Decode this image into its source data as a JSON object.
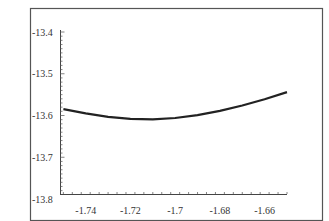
{
  "chart_data": {
    "type": "line",
    "title": "",
    "xlabel": "",
    "ylabel": "",
    "xlim": [
      -1.7515,
      -1.65
    ],
    "ylim": [
      -13.8,
      -13.4
    ],
    "grid": false,
    "legend": null,
    "x_ticks": [
      "-1.74",
      "-1.72",
      "-1.7",
      "-1.68",
      "-1.66"
    ],
    "x_tick_values": [
      -1.74,
      -1.72,
      -1.7,
      -1.68,
      -1.66
    ],
    "y_ticks": [
      "-13.4",
      "-13.5",
      "-13.6",
      "-13.7",
      "-13.8"
    ],
    "y_tick_values": [
      -13.4,
      -13.5,
      -13.6,
      -13.7,
      -13.8
    ],
    "series": [
      {
        "name": "curve",
        "color": "#222222",
        "x": [
          -1.75,
          -1.74,
          -1.73,
          -1.72,
          -1.71,
          -1.7,
          -1.69,
          -1.68,
          -1.67,
          -1.66,
          -1.65
        ],
        "y": [
          -13.585,
          -13.595,
          -13.603,
          -13.608,
          -13.609,
          -13.606,
          -13.599,
          -13.589,
          -13.576,
          -13.561,
          -13.544
        ]
      }
    ]
  }
}
